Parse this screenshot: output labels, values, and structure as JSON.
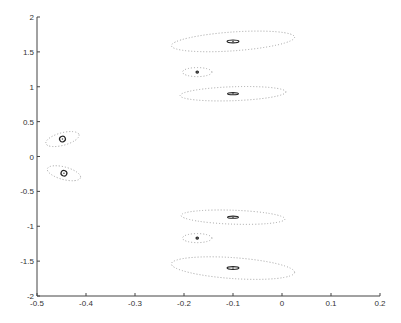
{
  "chart_data": {
    "type": "scatter",
    "title": "",
    "xlabel": "",
    "ylabel": "",
    "xlim": [
      -0.5,
      0.2
    ],
    "ylim": [
      -2,
      2
    ],
    "grid": false,
    "legend": "none",
    "x_ticks": [
      -0.5,
      -0.4,
      -0.3,
      -0.2,
      -0.1,
      0,
      0.1,
      0.2
    ],
    "x_tick_labels": [
      "-0.5",
      "-0.4",
      "-0.3",
      "-0.2",
      "-0.1",
      "0",
      "0.1",
      "0.2"
    ],
    "y_ticks": [
      -2,
      -1.5,
      -1,
      -0.5,
      0,
      0.5,
      1,
      1.5,
      2
    ],
    "y_tick_labels": [
      "-2",
      "-1.5",
      "-1",
      "-0.5",
      "0",
      "0.5",
      "1",
      "1.5",
      "2"
    ],
    "series": [
      {
        "name": "clusters",
        "description": "Cluster centers with inner (solid) and outer (dotted) confidence ellipses",
        "points": [
          {
            "x": -0.1,
            "y": 1.65,
            "outer_rx": 0.126,
            "outer_ry": 0.135,
            "outer_tilt": -4,
            "inner_rx": 0.012,
            "inner_ry": 0.02,
            "inner_tilt": 0
          },
          {
            "x": -0.173,
            "y": 1.21,
            "outer_rx": 0.03,
            "outer_ry": 0.065,
            "outer_tilt": 0,
            "inner_rx": 0.002,
            "inner_ry": 0.01,
            "inner_tilt": 0
          },
          {
            "x": -0.1,
            "y": 0.9,
            "outer_rx": 0.108,
            "outer_ry": 0.1,
            "outer_tilt": -2,
            "inner_rx": 0.011,
            "inner_ry": 0.015,
            "inner_tilt": 0
          },
          {
            "x": -0.448,
            "y": 0.25,
            "outer_rx": 0.035,
            "outer_ry": 0.09,
            "outer_tilt": -15,
            "inner_rx": 0.006,
            "inner_ry": 0.04,
            "inner_tilt": -25
          },
          {
            "x": -0.445,
            "y": -0.24,
            "outer_rx": 0.035,
            "outer_ry": 0.09,
            "outer_tilt": 15,
            "inner_rx": 0.006,
            "inner_ry": 0.04,
            "inner_tilt": 25
          },
          {
            "x": -0.1,
            "y": -0.87,
            "outer_rx": 0.106,
            "outer_ry": 0.1,
            "outer_tilt": 2,
            "inner_rx": 0.011,
            "inner_ry": 0.015,
            "inner_tilt": 0
          },
          {
            "x": -0.173,
            "y": -1.17,
            "outer_rx": 0.03,
            "outer_ry": 0.065,
            "outer_tilt": 0,
            "inner_rx": 0.002,
            "inner_ry": 0.01,
            "inner_tilt": 0
          },
          {
            "x": -0.1,
            "y": -1.6,
            "outer_rx": 0.126,
            "outer_ry": 0.15,
            "outer_tilt": 4,
            "inner_rx": 0.012,
            "inner_ry": 0.02,
            "inner_tilt": 0
          }
        ]
      }
    ]
  }
}
